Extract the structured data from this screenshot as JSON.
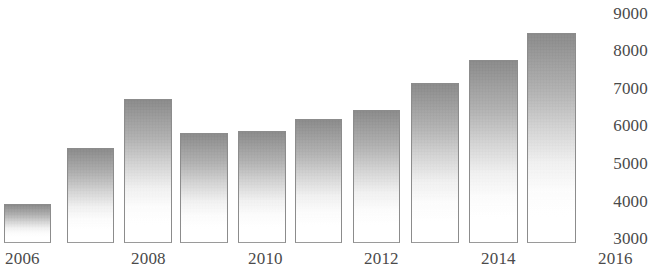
{
  "chart_data": {
    "type": "bar",
    "title": "",
    "subtitle": "",
    "xlabel": "",
    "ylabel": "",
    "categories": [
      "2006",
      "2007",
      "2008",
      "2009",
      "2010",
      "2011",
      "2012",
      "2013",
      "2014",
      "2015"
    ],
    "values": [
      3900,
      5400,
      6700,
      5800,
      5850,
      6200,
      6400,
      7150,
      7750,
      8450
    ],
    "series": [
      {
        "name": "",
        "values": [
          3900,
          5400,
          6700,
          5800,
          5850,
          6200,
          6400,
          7150,
          7750,
          8450
        ]
      }
    ],
    "ylim": [
      2900,
      9200
    ],
    "yticks": [
      3000,
      4000,
      5000,
      6000,
      7000,
      8000,
      9000
    ],
    "ytick_labels": [
      "3000",
      "4000",
      "5000",
      "6000",
      "7000",
      "8000",
      "9000"
    ],
    "xticks": [
      2006,
      2008,
      2010,
      2012,
      2014,
      2016
    ],
    "xtick_labels": [
      "2006",
      "2008",
      "2010",
      "2012",
      "2014",
      "2016"
    ],
    "grid": false,
    "legend": null,
    "bar_color": "#9a9a9a",
    "bar_gradient": "gray-to-white",
    "axis_color": "#4a4a4a",
    "background": "#ffffff"
  },
  "axes": {
    "y": {
      "ticks": [
        {
          "label": "9000",
          "top": 5
        },
        {
          "label": "8000",
          "top": 42
        },
        {
          "label": "7000",
          "top": 80
        },
        {
          "label": "6000",
          "top": 117
        },
        {
          "label": "5000",
          "top": 155
        },
        {
          "label": "4000",
          "top": 193
        },
        {
          "label": "3000",
          "top": 230
        }
      ]
    },
    "x": {
      "ticks": [
        {
          "label": "2006",
          "left": 5
        },
        {
          "label": "2008",
          "left": 131
        },
        {
          "label": "2010",
          "left": 248
        },
        {
          "label": "2012",
          "left": 364
        },
        {
          "label": "2014",
          "left": 481
        },
        {
          "label": "2016",
          "left": 598
        }
      ]
    }
  },
  "bars": [
    {
      "category": "2006",
      "value": 3900,
      "left": 4,
      "top": 204,
      "width": 47,
      "height": 39
    },
    {
      "category": "2007",
      "value": 5400,
      "left": 67,
      "top": 148,
      "width": 47,
      "height": 95
    },
    {
      "category": "2008",
      "value": 6700,
      "left": 124,
      "top": 99,
      "width": 48,
      "height": 144
    },
    {
      "category": "2009",
      "value": 5800,
      "left": 180,
      "top": 133,
      "width": 48,
      "height": 110
    },
    {
      "category": "2010",
      "value": 5850,
      "left": 238,
      "top": 131,
      "width": 48,
      "height": 112
    },
    {
      "category": "2011",
      "value": 6200,
      "left": 295,
      "top": 119,
      "width": 47,
      "height": 124
    },
    {
      "category": "2012",
      "value": 6400,
      "left": 353,
      "top": 110,
      "width": 47,
      "height": 133
    },
    {
      "category": "2013",
      "value": 7150,
      "left": 411,
      "top": 83,
      "width": 48,
      "height": 160
    },
    {
      "category": "2014",
      "value": 7750,
      "left": 469,
      "top": 60,
      "width": 49,
      "height": 183
    },
    {
      "category": "2015",
      "value": 8450,
      "left": 527,
      "top": 33,
      "width": 49,
      "height": 210
    }
  ]
}
